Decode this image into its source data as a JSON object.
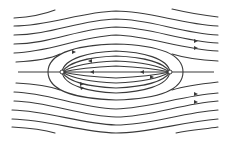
{
  "diagram": {
    "title": "Source–sink pair in uniform flow (Rankine oval) streamlines",
    "elements": {
      "source": {
        "label": "source",
        "x": 62,
        "y": 72
      },
      "sink": {
        "label": "sink",
        "x": 170,
        "y": 72
      },
      "axis": {
        "label": "dividing streamline axis"
      },
      "stroke_color": "#3a3a3a",
      "background": "#ffffff"
    },
    "counts": {
      "outer_streamlines_above": 6,
      "outer_streamlines_below": 6,
      "inner_streamlines_above": 4,
      "inner_streamlines_below": 4
    }
  }
}
